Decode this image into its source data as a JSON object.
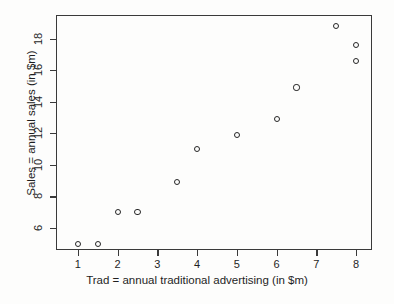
{
  "chart_data": {
    "type": "scatter",
    "title": "",
    "xlabel": "Trad = annual traditional advertising (in $m)",
    "ylabel": "Sales = annual sales (in $m)",
    "xlim": [
      0.45,
      8.4
    ],
    "ylim": [
      4.6,
      19.5
    ],
    "xticks": [
      1,
      2,
      3,
      4,
      5,
      6,
      7,
      8
    ],
    "xticklabels": [
      "1",
      "2",
      "3",
      "4",
      "5",
      "6",
      "7",
      "8"
    ],
    "yticks": [
      6,
      8,
      10,
      12,
      14,
      16,
      18
    ],
    "yticklabels": [
      "6",
      "8",
      "10",
      "12",
      "14",
      "16",
      "18"
    ],
    "grid": false,
    "legend": null,
    "marker": "open-circle",
    "marker_color": "#262626",
    "frame_color": "#3a3a3a",
    "background": "#ffffff",
    "x": [
      1.0,
      1.5,
      2.0,
      2.5,
      3.5,
      4.0,
      5.0,
      6.0,
      6.5,
      7.5,
      8.0,
      8.0
    ],
    "y": [
      5.0,
      5.0,
      7.0,
      7.0,
      8.9,
      11.0,
      11.9,
      12.9,
      14.9,
      18.8,
      17.6,
      16.6
    ],
    "points": [
      {
        "x": 1.0,
        "y": 5.0
      },
      {
        "x": 1.5,
        "y": 5.0
      },
      {
        "x": 2.0,
        "y": 7.0
      },
      {
        "x": 2.5,
        "y": 7.0
      },
      {
        "x": 3.5,
        "y": 8.9
      },
      {
        "x": 4.0,
        "y": 11.0
      },
      {
        "x": 5.0,
        "y": 11.9
      },
      {
        "x": 6.0,
        "y": 12.9
      },
      {
        "x": 6.5,
        "y": 14.9
      },
      {
        "x": 7.5,
        "y": 18.8
      },
      {
        "x": 8.0,
        "y": 17.6
      },
      {
        "x": 8.0,
        "y": 16.6
      }
    ]
  }
}
